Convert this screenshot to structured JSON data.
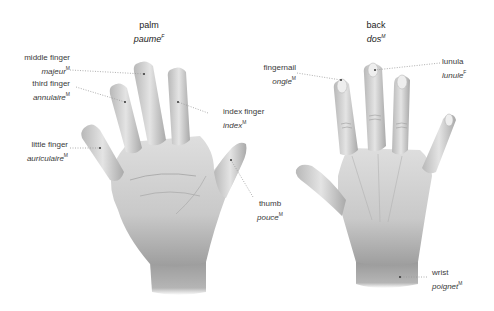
{
  "views": [
    {
      "id": "palm",
      "title_en": "palm",
      "title_fr": "paume",
      "title_gender": "F"
    },
    {
      "id": "back",
      "title_en": "back",
      "title_fr": "dos",
      "title_gender": "M"
    }
  ],
  "labels": {
    "middle_finger": {
      "en": "middle finger",
      "fr": "majeur",
      "gender": "M"
    },
    "third_finger": {
      "en": "third finger",
      "fr": "annulaire",
      "gender": "M"
    },
    "little_finger": {
      "en": "little finger",
      "fr": "auriculaire",
      "gender": "M"
    },
    "index_finger": {
      "en": "index finger",
      "fr": "index",
      "gender": "M"
    },
    "thumb": {
      "en": "thumb",
      "fr": "pouce",
      "gender": "M"
    },
    "fingernail": {
      "en": "fingernail",
      "fr": "ongle",
      "gender": "M"
    },
    "lunula": {
      "en": "lunula",
      "fr": "lunule",
      "gender": "F"
    },
    "wrist": {
      "en": "wrist",
      "fr": "poignet",
      "gender": "M"
    }
  },
  "colors": {
    "skin_light": "#e6e6e6",
    "skin_mid": "#c4c4c4",
    "skin_dark": "#8f8f8f",
    "leader_line": "#9a9a9a",
    "text": "#3a3a3a"
  }
}
